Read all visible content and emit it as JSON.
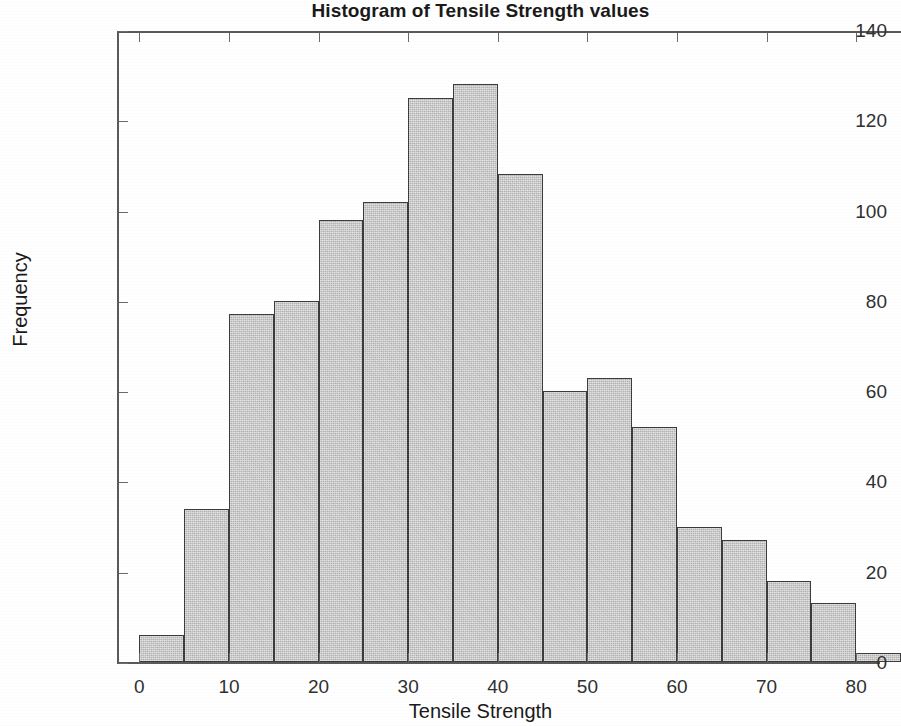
{
  "chart_data": {
    "type": "bar",
    "title": "Histogram of Tensile Strength values",
    "xlabel": "Tensile Strength",
    "ylabel": "Frequency",
    "grid": false,
    "legend": null,
    "xlim": [
      -2.5,
      85
    ],
    "ylim": [
      0,
      140
    ],
    "xticks": [
      "0",
      "10",
      "20",
      "30",
      "40",
      "50",
      "60",
      "70",
      "80"
    ],
    "xtick_values": [
      0,
      10,
      20,
      30,
      40,
      50,
      60,
      70,
      80
    ],
    "yticks": [
      "0",
      "20",
      "40",
      "60",
      "80",
      "100",
      "120",
      "140"
    ],
    "ytick_values": [
      0,
      20,
      40,
      60,
      80,
      100,
      120,
      140
    ],
    "bin_width": 5,
    "bin_edges": [
      0,
      5,
      10,
      15,
      20,
      25,
      30,
      35,
      40,
      45,
      50,
      55,
      60,
      65,
      70,
      75,
      80,
      85
    ],
    "categories": [
      "0-5",
      "5-10",
      "10-15",
      "15-20",
      "20-25",
      "25-30",
      "30-35",
      "35-40",
      "40-45",
      "45-50",
      "50-55",
      "55-60",
      "60-65",
      "65-70",
      "70-75",
      "75-80",
      "80-85"
    ],
    "values": [
      6,
      34,
      77,
      80,
      98,
      102,
      125,
      128,
      108,
      60,
      63,
      52,
      30,
      27,
      18,
      13,
      2
    ],
    "bar_face_color": "#c9c9c9",
    "bar_edge_color": "#3c3c3c",
    "axis_color": "#5a5a5a",
    "text_color": "#1a1a1a"
  }
}
